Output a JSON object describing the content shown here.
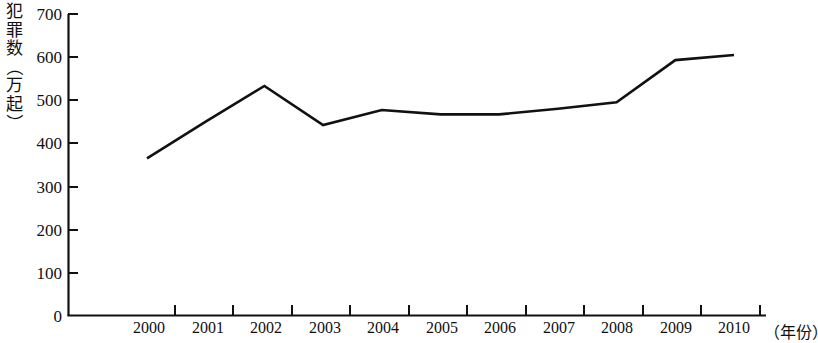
{
  "chart_data": {
    "type": "line",
    "title": "",
    "xlabel": "（年份）",
    "ylabel": "犯罪数（万起）",
    "categories": [
      "2000",
      "2001",
      "2002",
      "2003",
      "2004",
      "2005",
      "2006",
      "2007",
      "2008",
      "2009",
      "2010"
    ],
    "values": [
      365,
      450,
      533,
      442,
      477,
      467,
      467,
      480,
      495,
      593,
      605
    ],
    "series": [
      {
        "name": "犯罪数",
        "values": [
          365,
          450,
          533,
          442,
          477,
          467,
          467,
          480,
          495,
          593,
          605
        ]
      }
    ],
    "ylim": [
      0,
      700
    ],
    "ytick_labels": [
      "0",
      "100",
      "200",
      "300",
      "400",
      "500",
      "600",
      "700"
    ],
    "ytick_values": [
      0,
      100,
      200,
      300,
      400,
      500,
      600,
      700
    ],
    "grid": false,
    "legend": "none",
    "line_color": "#111111",
    "axis_color": "#111111"
  },
  "axis": {
    "y_title_chars": [
      "犯",
      "罪",
      "数",
      "（",
      "万",
      "起",
      "）"
    ],
    "x_unit_label": "（年份）"
  }
}
